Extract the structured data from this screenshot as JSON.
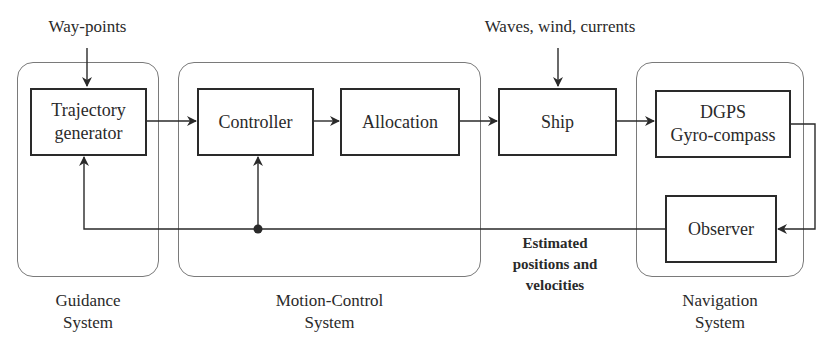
{
  "diagram": {
    "type": "block-diagram",
    "inputs": {
      "waypoints": "Way-points",
      "disturbances": "Waves, wind, currents"
    },
    "groups": [
      {
        "id": "guidance",
        "label_line1": "Guidance",
        "label_line2": "System"
      },
      {
        "id": "motion_control",
        "label_line1": "Motion-Control",
        "label_line2": "System"
      },
      {
        "id": "navigation",
        "label_line1": "Navigation",
        "label_line2": "System"
      }
    ],
    "blocks": {
      "trajectory": {
        "line1": "Trajectory",
        "line2": "generator"
      },
      "controller": "Controller",
      "allocation": "Allocation",
      "ship": "Ship",
      "sensors": {
        "line1": "DGPS",
        "line2": "Gyro-compass"
      },
      "observer": "Observer"
    },
    "feedback_label": {
      "line1": "Estimated",
      "line2": "positions and",
      "line3": "velocities"
    },
    "edges": [
      [
        "Way-points",
        "Trajectory generator"
      ],
      [
        "Trajectory generator",
        "Controller"
      ],
      [
        "Controller",
        "Allocation"
      ],
      [
        "Allocation",
        "Ship"
      ],
      [
        "Waves, wind, currents",
        "Ship"
      ],
      [
        "Ship",
        "DGPS Gyro-compass"
      ],
      [
        "DGPS Gyro-compass",
        "Observer"
      ],
      [
        "Observer",
        "Controller"
      ],
      [
        "Observer",
        "Trajectory generator"
      ]
    ],
    "colors": {
      "line": "#2a2a2a",
      "group_border": "#7a7a7a",
      "background": "#ffffff"
    }
  }
}
